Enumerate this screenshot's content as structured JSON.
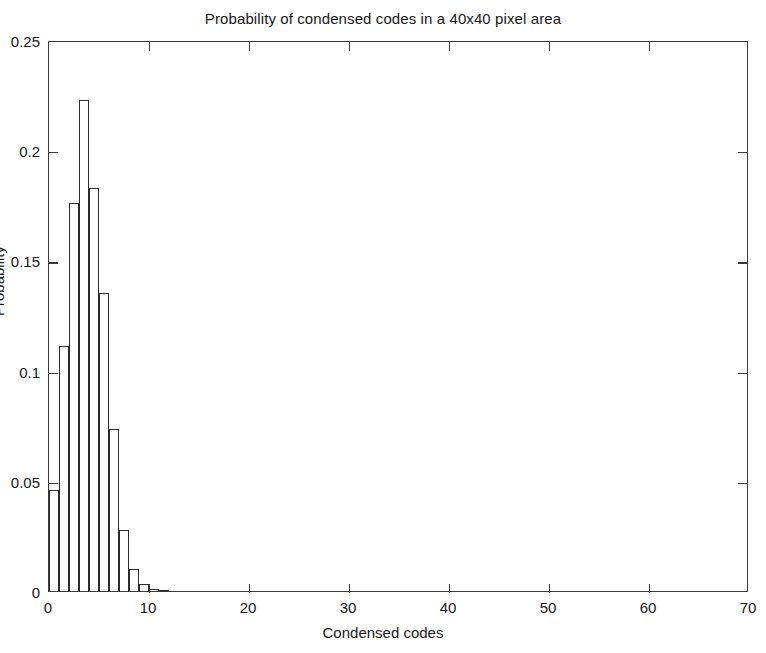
{
  "chart_data": {
    "type": "bar",
    "title": "Probability of condensed codes in a 40x40 pixel area",
    "xlabel": "Condensed codes",
    "ylabel": "Probability",
    "xlim": [
      0,
      70
    ],
    "ylim": [
      0,
      0.25
    ],
    "xticks": [
      0,
      10,
      20,
      30,
      40,
      50,
      60,
      70
    ],
    "xticklabels": [
      "0",
      "10",
      "20",
      "30",
      "40",
      "50",
      "60",
      "70"
    ],
    "yticks": [
      0,
      0.05,
      0.1,
      0.15,
      0.2,
      0.25
    ],
    "yticklabels": [
      "0",
      "0.05",
      "0.1",
      "0.15",
      "0.2",
      "0.25"
    ],
    "grid": false,
    "legend": null,
    "bar_width": 1,
    "bar_color": "#ffffff",
    "bar_edge_color": "#2b2b2b",
    "categories": [
      1,
      2,
      3,
      4,
      5,
      6,
      7,
      8,
      9,
      10,
      11,
      12
    ],
    "values": [
      0.046,
      0.111,
      0.176,
      0.223,
      0.183,
      0.135,
      0.0735,
      0.0275,
      0.01,
      0.003,
      0.001,
      0.0005
    ]
  },
  "axes": {
    "frame_color": "#3a3a3a"
  }
}
